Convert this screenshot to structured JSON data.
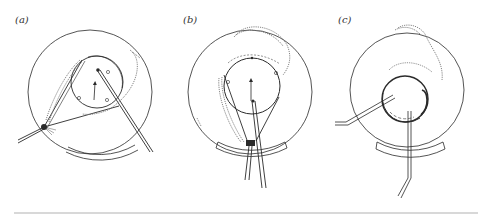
{
  "figure": {
    "panels": [
      {
        "id": "a",
        "label": "(a)"
      },
      {
        "id": "b",
        "label": "(b)"
      },
      {
        "id": "c",
        "label": "(c)"
      }
    ],
    "colors": {
      "line": "#2a2a2a",
      "dotted": "#777777",
      "rule": "#d8d8d8"
    }
  }
}
